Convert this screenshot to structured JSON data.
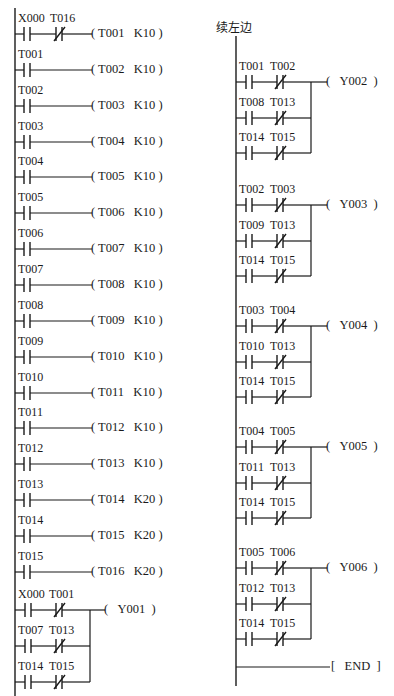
{
  "continuation_label": "续左边",
  "left_timer_rungs": [
    {
      "contacts": [
        {
          "name": "X000",
          "type": "NO"
        },
        {
          "name": "T016",
          "type": "NC"
        }
      ],
      "coil": "T001",
      "k": "K10"
    },
    {
      "contacts": [
        {
          "name": "T001",
          "type": "NO"
        }
      ],
      "coil": "T002",
      "k": "K10"
    },
    {
      "contacts": [
        {
          "name": "T002",
          "type": "NO"
        }
      ],
      "coil": "T003",
      "k": "K10"
    },
    {
      "contacts": [
        {
          "name": "T003",
          "type": "NO"
        }
      ],
      "coil": "T004",
      "k": "K10"
    },
    {
      "contacts": [
        {
          "name": "T004",
          "type": "NO"
        }
      ],
      "coil": "T005",
      "k": "K10"
    },
    {
      "contacts": [
        {
          "name": "T005",
          "type": "NO"
        }
      ],
      "coil": "T006",
      "k": "K10"
    },
    {
      "contacts": [
        {
          "name": "T006",
          "type": "NO"
        }
      ],
      "coil": "T007",
      "k": "K10"
    },
    {
      "contacts": [
        {
          "name": "T007",
          "type": "NO"
        }
      ],
      "coil": "T008",
      "k": "K10"
    },
    {
      "contacts": [
        {
          "name": "T008",
          "type": "NO"
        }
      ],
      "coil": "T009",
      "k": "K10"
    },
    {
      "contacts": [
        {
          "name": "T009",
          "type": "NO"
        }
      ],
      "coil": "T010",
      "k": "K10"
    },
    {
      "contacts": [
        {
          "name": "T010",
          "type": "NO"
        }
      ],
      "coil": "T011",
      "k": "K10"
    },
    {
      "contacts": [
        {
          "name": "T011",
          "type": "NO"
        }
      ],
      "coil": "T012",
      "k": "K10"
    },
    {
      "contacts": [
        {
          "name": "T012",
          "type": "NO"
        }
      ],
      "coil": "T013",
      "k": "K10"
    },
    {
      "contacts": [
        {
          "name": "T013",
          "type": "NO"
        }
      ],
      "coil": "T014",
      "k": "K20"
    },
    {
      "contacts": [
        {
          "name": "T014",
          "type": "NO"
        }
      ],
      "coil": "T015",
      "k": "K20"
    },
    {
      "contacts": [
        {
          "name": "T015",
          "type": "NO"
        }
      ],
      "coil": "T016",
      "k": "K20"
    }
  ],
  "output_rungs": [
    {
      "coil": "Y001",
      "branches": [
        [
          "X000",
          "T001"
        ],
        [
          "T007",
          "T013"
        ],
        [
          "T014",
          "T015"
        ]
      ]
    },
    {
      "coil": "Y002",
      "branches": [
        [
          "T001",
          "T002"
        ],
        [
          "T008",
          "T013"
        ],
        [
          "T014",
          "T015"
        ]
      ]
    },
    {
      "coil": "Y003",
      "branches": [
        [
          "T002",
          "T003"
        ],
        [
          "T009",
          "T013"
        ],
        [
          "T014",
          "T015"
        ]
      ]
    },
    {
      "coil": "Y004",
      "branches": [
        [
          "T003",
          "T004"
        ],
        [
          "T010",
          "T013"
        ],
        [
          "T014",
          "T015"
        ]
      ]
    },
    {
      "coil": "Y005",
      "branches": [
        [
          "T004",
          "T005"
        ],
        [
          "T011",
          "T013"
        ],
        [
          "T014",
          "T015"
        ]
      ]
    },
    {
      "coil": "Y006",
      "branches": [
        [
          "T005",
          "T006"
        ],
        [
          "T012",
          "T013"
        ],
        [
          "T014",
          "T015"
        ]
      ]
    }
  ],
  "end_instruction": "END",
  "colors": {
    "line": "#1a1a1a",
    "background": "#ffffff"
  }
}
